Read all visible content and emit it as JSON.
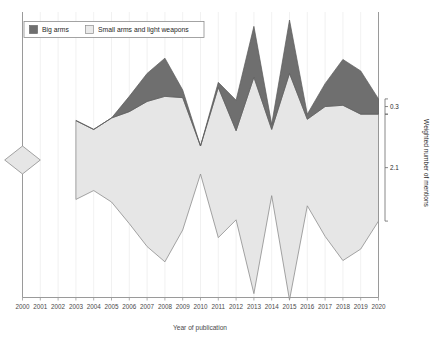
{
  "chart_data": {
    "type": "area",
    "title": "",
    "subtitle": "",
    "xlabel": "Year of publication",
    "ylabel": "Weighted number of mentions",
    "grid": true,
    "grid_axis": "x",
    "legend_position": "top-left",
    "stacking": "streamgraph-centered",
    "xlim": [
      2000,
      2020
    ],
    "x_tick_step": 1,
    "categories": [
      "2000",
      "2001",
      "2002",
      "2003",
      "2004",
      "2005",
      "2006",
      "2007",
      "2008",
      "2009",
      "2010",
      "2011",
      "2012",
      "2013",
      "2014",
      "2015",
      "2016",
      "2017",
      "2018",
      "2019",
      "2020"
    ],
    "xticklabels": [
      "2000",
      "2001",
      "2002",
      "2003",
      "2004",
      "2005",
      "2006",
      "2007",
      "2008",
      "2009",
      "2010",
      "2011",
      "2012",
      "2013",
      "2014",
      "2015",
      "2016",
      "2017",
      "2018",
      "2019",
      "2020"
    ],
    "series": [
      {
        "name": "Small arms and light weapons",
        "color": "#e6e6e6",
        "stroke": "#8d8d8d",
        "legend_swatch": "#eaeaea",
        "values": [
          0.55,
          0.0,
          0.0,
          1.55,
          1.2,
          1.65,
          2.2,
          2.85,
          3.25,
          2.6,
          0.55,
          2.95,
          1.75,
          4.25,
          1.3,
          4.45,
          1.7,
          2.55,
          3.05,
          2.65,
          2.1
        ]
      },
      {
        "name": "Big arms",
        "color": "#6f6f6f",
        "stroke": "#5a5a5a",
        "legend_swatch": "#6f6f6f",
        "values": [
          0.0,
          0.0,
          0.0,
          0.0,
          0.0,
          0.0,
          0.3,
          0.55,
          0.75,
          0.15,
          0.0,
          0.1,
          0.6,
          1.0,
          0.1,
          1.05,
          0.1,
          0.45,
          0.9,
          0.85,
          0.3
        ]
      }
    ],
    "gaps": [
      "2002"
    ],
    "y_brackets": [
      {
        "label": "0.3",
        "series": "Big arms",
        "span_from": 0.0,
        "span_to": 0.3
      },
      {
        "label": "2.1",
        "series": "Small arms and light weapons",
        "span_from": 0.0,
        "span_to": 2.1
      }
    ]
  },
  "legend": {
    "items": [
      {
        "label": "Big arms",
        "swatch": "#6f6f6f"
      },
      {
        "label": "Small arms and light weapons",
        "swatch": "#eaeaea"
      }
    ]
  },
  "axes": {
    "x_title": "Year of publication",
    "y_title": "Weighted number of mentions",
    "bracket_upper": "0.3",
    "bracket_lower": "2.1"
  }
}
